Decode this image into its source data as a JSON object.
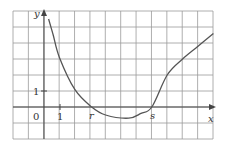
{
  "chart_data": {
    "type": "line",
    "title": "",
    "xlabel": "x",
    "ylabel": "y",
    "grid": true,
    "tick_labels": {
      "origin": "0",
      "x_unit": "1",
      "y_unit": "1"
    },
    "roots": [
      {
        "label": "r",
        "x": 3.1
      },
      {
        "label": "s",
        "x": 7.0
      }
    ],
    "xlim": [
      -2,
      11
    ],
    "ylim": [
      -2,
      6
    ],
    "series": [
      {
        "name": "f(x)",
        "x": [
          0.3,
          0.6,
          1.0,
          2.0,
          3.1,
          4.0,
          5.5,
          6.3,
          7.0,
          8.0,
          9.0,
          10.0,
          11.0
        ],
        "y": [
          5.5,
          4.5,
          3.1,
          1.1,
          0.0,
          -0.5,
          -0.7,
          -0.4,
          0.0,
          2.0,
          3.0,
          3.8,
          4.6
        ]
      }
    ]
  },
  "labels": {
    "y_axis": "y",
    "x_axis": "x",
    "origin": "0",
    "x_one": "1",
    "y_one": "1",
    "root_r": "r",
    "root_s": "s"
  },
  "colors": {
    "grid": "#9a9a9a",
    "axis": "#444444",
    "curve": "#555555"
  }
}
